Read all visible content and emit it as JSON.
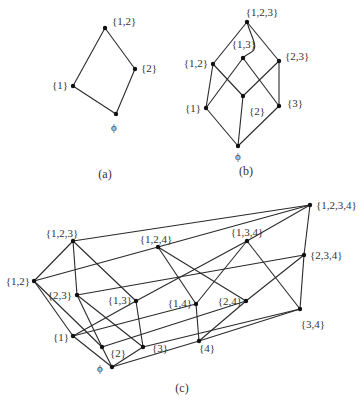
{
  "colors": {
    "edge": "#2a2a2a",
    "node": "#111111",
    "text": "#333333",
    "background": "#ffffff"
  },
  "diagrams": [
    {
      "id": "a",
      "caption": "(a)",
      "caption_pos": [
        105,
        178
      ],
      "nodes": [
        {
          "id": "12",
          "label": "{1,2}",
          "x": 105,
          "y": 28,
          "lx": 112,
          "ly": 25,
          "anchor": "start"
        },
        {
          "id": "2",
          "label": "{2}",
          "x": 135,
          "y": 69,
          "lx": 141,
          "ly": 72,
          "anchor": "start"
        },
        {
          "id": "1",
          "label": "{1}",
          "x": 73,
          "y": 86,
          "lx": 68,
          "ly": 89,
          "anchor": "end"
        },
        {
          "id": "0",
          "label": "ϕ",
          "x": 116,
          "y": 114,
          "lx": 114,
          "ly": 131,
          "anchor": "middle"
        }
      ],
      "edges": [
        [
          "12",
          "2"
        ],
        [
          "12",
          "1"
        ],
        [
          "2",
          "0"
        ],
        [
          "1",
          "0"
        ]
      ]
    },
    {
      "id": "b",
      "caption": "(b)",
      "caption_pos": [
        246,
        175
      ],
      "nodes": [
        {
          "id": "123",
          "label": "{1,2,3}",
          "x": 247,
          "y": 22,
          "lx": 262,
          "ly": 16,
          "anchor": "middle"
        },
        {
          "id": "13",
          "label": "{1,3}",
          "x": 243,
          "y": 58,
          "lx": 244,
          "ly": 48,
          "anchor": "middle"
        },
        {
          "id": "12",
          "label": "{1,2}",
          "x": 213,
          "y": 64,
          "lx": 208,
          "ly": 67,
          "anchor": "end"
        },
        {
          "id": "23",
          "label": "{2,3}",
          "x": 279,
          "y": 61,
          "lx": 285,
          "ly": 60,
          "anchor": "start"
        },
        {
          "id": "2",
          "label": "{2}",
          "x": 243,
          "y": 96,
          "lx": 249,
          "ly": 115,
          "anchor": "start"
        },
        {
          "id": "1",
          "label": "{1}",
          "x": 206,
          "y": 108,
          "lx": 201,
          "ly": 112,
          "anchor": "end"
        },
        {
          "id": "3",
          "label": "{3}",
          "x": 279,
          "y": 106,
          "lx": 287,
          "ly": 107,
          "anchor": "start"
        },
        {
          "id": "0",
          "label": "ϕ",
          "x": 238,
          "y": 146,
          "lx": 238,
          "ly": 160,
          "anchor": "middle"
        }
      ],
      "edges": [
        [
          "123",
          "12"
        ],
        [
          "123",
          "23"
        ],
        [
          "12",
          "1"
        ],
        [
          "12",
          "2"
        ],
        [
          "13",
          "1"
        ],
        [
          "13",
          "3"
        ],
        [
          "23",
          "2"
        ],
        [
          "23",
          "3"
        ],
        [
          "1",
          "0"
        ],
        [
          "2",
          "0"
        ],
        [
          "3",
          "0"
        ]
      ],
      "curved_edges": [
        {
          "from": "123",
          "to": "13",
          "path": "M247,22 C252,40 260,48 250,53 C246,55 244,57 243,58"
        }
      ]
    },
    {
      "id": "c",
      "caption": "(c)",
      "caption_pos": [
        182,
        392
      ],
      "nodes": [
        {
          "id": "1234",
          "label": "{1,2,3,4}",
          "x": 310,
          "y": 205,
          "lx": 316,
          "ly": 209,
          "anchor": "start"
        },
        {
          "id": "123",
          "label": "{1,2,3}",
          "x": 73,
          "y": 241,
          "lx": 62,
          "ly": 237,
          "anchor": "middle"
        },
        {
          "id": "124",
          "label": "{1,2,4}",
          "x": 158,
          "y": 247,
          "lx": 156,
          "ly": 243,
          "anchor": "middle"
        },
        {
          "id": "134",
          "label": "{1,3,4}",
          "x": 247,
          "y": 241,
          "lx": 247,
          "ly": 236,
          "anchor": "middle"
        },
        {
          "id": "234",
          "label": "{2,3,4}",
          "x": 304,
          "y": 255,
          "lx": 310,
          "ly": 259,
          "anchor": "start"
        },
        {
          "id": "12",
          "label": "{1,2}",
          "x": 34,
          "y": 281,
          "lx": 30,
          "ly": 285,
          "anchor": "end"
        },
        {
          "id": "23",
          "label": "{2,3}",
          "x": 77,
          "y": 295,
          "lx": 72,
          "ly": 299,
          "anchor": "end"
        },
        {
          "id": "13",
          "label": "{1,3}",
          "x": 136,
          "y": 301,
          "lx": 132,
          "ly": 304,
          "anchor": "end"
        },
        {
          "id": "14",
          "label": "{1,4}",
          "x": 196,
          "y": 304,
          "lx": 192,
          "ly": 307,
          "anchor": "end"
        },
        {
          "id": "24",
          "label": "{2,4}",
          "x": 246,
          "y": 301,
          "lx": 242,
          "ly": 305,
          "anchor": "end"
        },
        {
          "id": "34",
          "label": "{3,4}",
          "x": 300,
          "y": 309,
          "lx": 313,
          "ly": 328,
          "anchor": "middle"
        },
        {
          "id": "1",
          "label": "{1}",
          "x": 73,
          "y": 336,
          "lx": 69,
          "ly": 341,
          "anchor": "end"
        },
        {
          "id": "2",
          "label": "{2}",
          "x": 102,
          "y": 347,
          "lx": 118,
          "ly": 357,
          "anchor": "middle"
        },
        {
          "id": "3",
          "label": "{3}",
          "x": 143,
          "y": 347,
          "lx": 160,
          "ly": 352,
          "anchor": "middle"
        },
        {
          "id": "4",
          "label": "{4}",
          "x": 199,
          "y": 341,
          "lx": 207,
          "ly": 352,
          "anchor": "middle"
        },
        {
          "id": "0",
          "label": "ϕ",
          "x": 112,
          "y": 367,
          "lx": 100,
          "ly": 372,
          "anchor": "middle"
        }
      ],
      "edges": [
        [
          "1234",
          "123"
        ],
        [
          "1234",
          "124"
        ],
        [
          "1234",
          "134"
        ],
        [
          "1234",
          "234"
        ],
        [
          "123",
          "12"
        ],
        [
          "123",
          "23"
        ],
        [
          "123",
          "13"
        ],
        [
          "124",
          "12"
        ],
        [
          "124",
          "14"
        ],
        [
          "124",
          "24"
        ],
        [
          "134",
          "13"
        ],
        [
          "134",
          "14"
        ],
        [
          "134",
          "34"
        ],
        [
          "234",
          "23"
        ],
        [
          "234",
          "24"
        ],
        [
          "234",
          "34"
        ],
        [
          "12",
          "1"
        ],
        [
          "12",
          "2"
        ],
        [
          "13",
          "1"
        ],
        [
          "13",
          "3"
        ],
        [
          "14",
          "1"
        ],
        [
          "14",
          "4"
        ],
        [
          "23",
          "2"
        ],
        [
          "23",
          "3"
        ],
        [
          "24",
          "2"
        ],
        [
          "24",
          "4"
        ],
        [
          "34",
          "3"
        ],
        [
          "34",
          "4"
        ],
        [
          "1",
          "0"
        ],
        [
          "2",
          "0"
        ],
        [
          "3",
          "0"
        ],
        [
          "4",
          "0"
        ]
      ]
    }
  ]
}
